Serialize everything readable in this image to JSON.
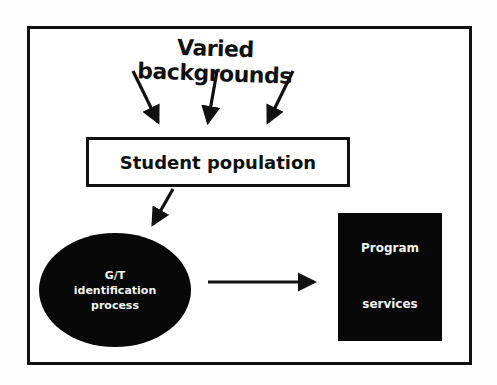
{
  "diagram": {
    "title": "Varied backgrounds",
    "nodes": {
      "student_population": {
        "label": "Student population",
        "shape": "rectangle",
        "fill": "#ffffff"
      },
      "identification": {
        "lines": [
          "G/T",
          "identification",
          "process"
        ],
        "shape": "ellipse",
        "fill": "#080808"
      },
      "program_services": {
        "lines": [
          "Program",
          "services"
        ],
        "shape": "rectangle",
        "fill": "#080808"
      }
    },
    "edges": [
      {
        "from": "Varied backgrounds",
        "to": "Student population",
        "count": 3
      },
      {
        "from": "Student population",
        "to": "G/T identification process"
      },
      {
        "from": "G/T identification process",
        "to": "Program services"
      }
    ],
    "colors": {
      "ink": "#111111",
      "background": "#ffffff"
    }
  }
}
